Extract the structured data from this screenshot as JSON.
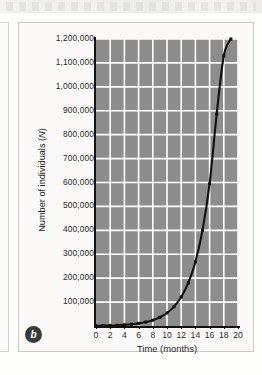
{
  "figure": {
    "panel_label": "b",
    "background_color": "#faf9f7",
    "plot_fill_color": "#8d8d8d",
    "gridline_color": "#ffffff",
    "curve_color": "#111111"
  },
  "chart_data": {
    "type": "line",
    "title": "",
    "subtitle": "",
    "xlabel": "Time (months)",
    "ylabel": "Number of individuals (N)",
    "ylabel_prefix": "Number of individuals (",
    "ylabel_italic": "N",
    "ylabel_suffix": ")",
    "xlim": [
      0,
      20
    ],
    "ylim": [
      0,
      1200000
    ],
    "grid": true,
    "legend": false,
    "legend_position": "none",
    "x_tick_labels": [
      "0",
      "2",
      "4",
      "6",
      "8",
      "10",
      "12",
      "14",
      "16",
      "18",
      "20"
    ],
    "x_ticks": [
      0,
      2,
      4,
      6,
      8,
      10,
      12,
      14,
      16,
      18,
      20
    ],
    "y_tick_labels": [
      "100,000",
      "200,000",
      "300,000",
      "400,000",
      "500,000",
      "600,000",
      "700,000",
      "800,000",
      "900,000",
      "1,000,000",
      "1,100,000",
      "1,200,000"
    ],
    "y_ticks": [
      100000,
      200000,
      300000,
      400000,
      500000,
      600000,
      700000,
      800000,
      900000,
      1000000,
      1100000,
      1200000
    ],
    "series": [
      {
        "name": "Population size",
        "marker": "square",
        "x": [
          0,
          1,
          2,
          3,
          4,
          5,
          6,
          7,
          8,
          9,
          10,
          11,
          12,
          13,
          14,
          15,
          16,
          17,
          18,
          19
        ],
        "values": [
          1000,
          1500,
          2200,
          3300,
          5000,
          7400,
          11000,
          16500,
          24500,
          36500,
          54500,
          81000,
          121000,
          180000,
          268000,
          400000,
          595000,
          886000,
          1130000,
          1200000
        ]
      }
    ],
    "annotations": []
  }
}
